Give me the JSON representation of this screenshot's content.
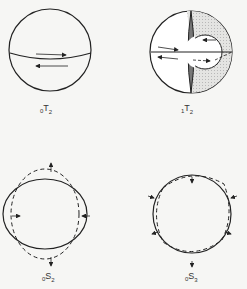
{
  "figure": {
    "panels": [
      {
        "id": "0T2",
        "label_prefix": "0",
        "label_main": "T",
        "label_sub": "2",
        "type": "toroidal",
        "description": "sphere with equatorial shear arrows"
      },
      {
        "id": "1T2",
        "label_prefix": "1",
        "label_main": "T",
        "label_sub": "2",
        "type": "toroidal",
        "description": "sphere with shaded inner core and nodal surface, opposite arrows"
      },
      {
        "id": "0S2",
        "label_prefix": "0",
        "label_main": "S",
        "label_sub": "2",
        "type": "spheroidal",
        "description": "football mode: solid ellipse vs dashed circle with radial arrows"
      },
      {
        "id": "0S3",
        "label_prefix": "0",
        "label_main": "S",
        "label_sub": "3",
        "type": "spheroidal",
        "description": "triangular deformation: solid circle vs dashed with radial arrows"
      }
    ],
    "colors": {
      "line": "#222222",
      "shade_light": "#d8d8d8",
      "shade_dark": "#777777",
      "background": "#f6f6f4"
    }
  }
}
